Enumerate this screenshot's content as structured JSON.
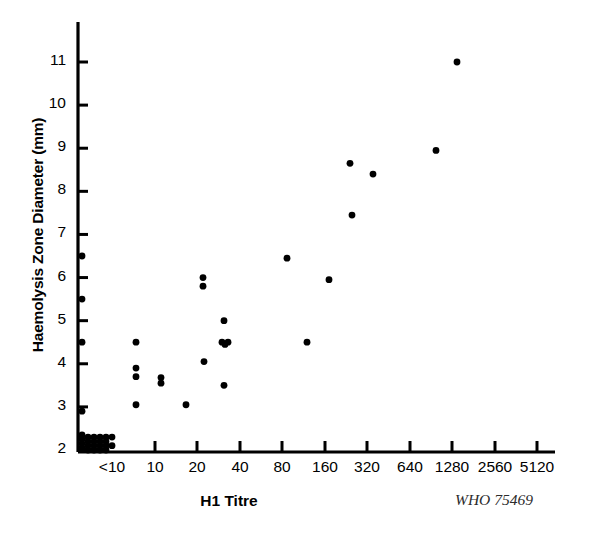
{
  "chart_data": {
    "type": "scatter",
    "title": "",
    "xlabel": "H1 Titre",
    "ylabel": "Haemolysis Zone Diameter (mm)",
    "credit": "WHO 75469",
    "grid": false,
    "legend": false,
    "x_tick_labels": [
      "<10",
      "10",
      "20",
      "40",
      "80",
      "160",
      "320",
      "640",
      "1280",
      "2560",
      "5120"
    ],
    "x_tick_px": [
      112,
      155,
      197,
      240,
      282,
      325,
      367,
      410,
      452,
      495,
      537
    ],
    "x_scale": "log2-doubling-dilution",
    "y_tick_labels": [
      "2",
      "3",
      "4",
      "5",
      "6",
      "7",
      "8",
      "9",
      "10",
      "11"
    ],
    "y_values": [
      2,
      3,
      4,
      5,
      6,
      7,
      8,
      9,
      10,
      11
    ],
    "ylim": [
      1.85,
      11.55
    ],
    "axis_px": {
      "left": 78,
      "bottom": 452,
      "top": 22,
      "right": 555
    },
    "y_px": {
      "v11": 62,
      "v2": 450
    },
    "point_color": "#000000",
    "point_radius_px": 3.4,
    "points": [
      {
        "titre": "<10",
        "x_px": 82,
        "y": 6.5
      },
      {
        "titre": "<10",
        "x_px": 82,
        "y": 5.5
      },
      {
        "titre": "<10",
        "x_px": 82,
        "y": 4.5
      },
      {
        "titre": "<10",
        "x_px": 82,
        "y": 2.9
      },
      {
        "titre": "<10",
        "x_px": 82,
        "y": 2.35
      },
      {
        "titre": "<10",
        "x_px": 82,
        "y": 2.25
      },
      {
        "titre": "<10",
        "x_px": 82,
        "y": 2.15
      },
      {
        "titre": "<10",
        "x_px": 82,
        "y": 2.05
      },
      {
        "titre": "<10",
        "x_px": 88,
        "y": 2.3
      },
      {
        "titre": "<10",
        "x_px": 88,
        "y": 2.2
      },
      {
        "titre": "<10",
        "x_px": 88,
        "y": 2.1
      },
      {
        "titre": "<10",
        "x_px": 88,
        "y": 2.0
      },
      {
        "titre": "<10",
        "x_px": 94,
        "y": 2.3
      },
      {
        "titre": "<10",
        "x_px": 94,
        "y": 2.2
      },
      {
        "titre": "<10",
        "x_px": 94,
        "y": 2.1
      },
      {
        "titre": "<10",
        "x_px": 94,
        "y": 2.0
      },
      {
        "titre": "<10",
        "x_px": 100,
        "y": 2.3
      },
      {
        "titre": "<10",
        "x_px": 100,
        "y": 2.2
      },
      {
        "titre": "<10",
        "x_px": 100,
        "y": 2.1
      },
      {
        "titre": "<10",
        "x_px": 100,
        "y": 2.0
      },
      {
        "titre": "<10",
        "x_px": 106,
        "y": 2.3
      },
      {
        "titre": "<10",
        "x_px": 106,
        "y": 2.2
      },
      {
        "titre": "<10",
        "x_px": 106,
        "y": 2.1
      },
      {
        "titre": "<10",
        "x_px": 106,
        "y": 2.0
      },
      {
        "titre": "<10",
        "x_px": 112,
        "y": 2.3
      },
      {
        "titre": "<10",
        "x_px": 112,
        "y": 2.1
      },
      {
        "titre": "15",
        "x_px": 136,
        "y": 4.5
      },
      {
        "titre": "15",
        "x_px": 136,
        "y": 3.9
      },
      {
        "titre": "15",
        "x_px": 136,
        "y": 3.7
      },
      {
        "titre": "15",
        "x_px": 136,
        "y": 3.05
      },
      {
        "titre": "20",
        "x_px": 161,
        "y": 3.68
      },
      {
        "titre": "20",
        "x_px": 161,
        "y": 3.55
      },
      {
        "titre": "30",
        "x_px": 186,
        "y": 3.05
      },
      {
        "titre": "40",
        "x_px": 203,
        "y": 6.0
      },
      {
        "titre": "40",
        "x_px": 203,
        "y": 5.8
      },
      {
        "titre": "40",
        "x_px": 204,
        "y": 4.05
      },
      {
        "titre": "60",
        "x_px": 224,
        "y": 5.0
      },
      {
        "titre": "60",
        "x_px": 222,
        "y": 4.5
      },
      {
        "titre": "60",
        "x_px": 228,
        "y": 4.5
      },
      {
        "titre": "60",
        "x_px": 225,
        "y": 4.45
      },
      {
        "titre": "60",
        "x_px": 224,
        "y": 3.5
      },
      {
        "titre": "160",
        "x_px": 287,
        "y": 6.45
      },
      {
        "titre": "160",
        "x_px": 307,
        "y": 4.5
      },
      {
        "titre": "320",
        "x_px": 329,
        "y": 5.95
      },
      {
        "titre": "450",
        "x_px": 350,
        "y": 8.65
      },
      {
        "titre": "450",
        "x_px": 352,
        "y": 7.45
      },
      {
        "titre": "640",
        "x_px": 373,
        "y": 8.4
      },
      {
        "titre": "1800",
        "x_px": 436,
        "y": 8.95
      },
      {
        "titre": "2560",
        "x_px": 457,
        "y": 11.0
      }
    ]
  }
}
